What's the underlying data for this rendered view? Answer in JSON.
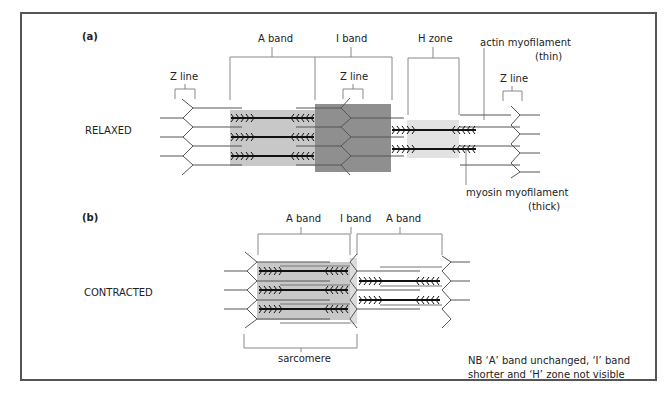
{
  "figure": {
    "panel_a": {
      "label": "(a)",
      "state": "RELAXED",
      "labels": {
        "a_band": "A band",
        "i_band": "I band",
        "h_zone": "H zone",
        "z_line_left": "Z line",
        "z_line_mid": "Z line",
        "z_line_right": "Z line",
        "actin_line1": "actin myofilament",
        "actin_line2": "(thin)",
        "myosin_line1": "myosin myofilament",
        "myosin_line2": "(thick)"
      }
    },
    "panel_b": {
      "label": "(b)",
      "state": "CONTRACTED",
      "labels": {
        "a_band_left": "A band",
        "i_band": "I band",
        "a_band_right": "A band",
        "sarcomere": "sarcomere"
      },
      "note_line1": "NB  ‘A’ band unchanged, ‘I’ band",
      "note_line2": "shorter and ‘H’ zone not visible"
    },
    "colors": {
      "frame": "#555555",
      "a_band_shade": "#c8c8c8",
      "i_band_shade": "#8f8f8f",
      "h_zone_shade": "#e2e2e2",
      "bracket": "#888888",
      "thick_filament": "#111111",
      "thin_filament": "#555555"
    }
  }
}
